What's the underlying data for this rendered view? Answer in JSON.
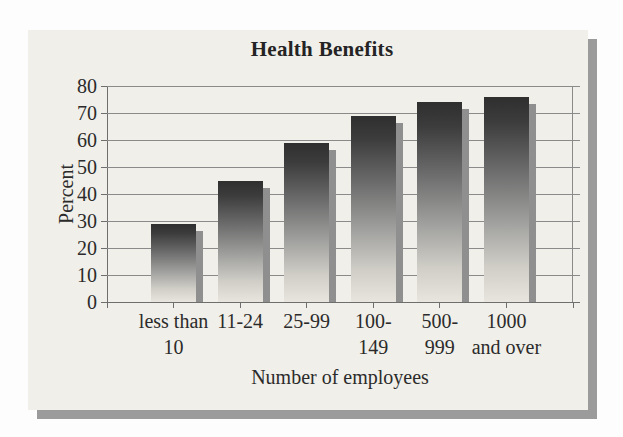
{
  "page": {
    "background": "#fdfdfd"
  },
  "panel": {
    "background": "#f1efe9",
    "shadow_color": "#9b9b9b"
  },
  "chart_data": {
    "type": "bar",
    "title": "Health Benefits",
    "xlabel": "Number of employees",
    "ylabel": "Percent",
    "categories": [
      "less than\n10",
      "11-24",
      "25-99",
      "100-\n149",
      "500-\n999",
      "1000\nand over"
    ],
    "values": [
      29,
      45,
      59,
      69,
      74,
      76
    ],
    "ylim": [
      0,
      80
    ],
    "yticks": [
      0,
      10,
      20,
      30,
      40,
      50,
      60,
      70,
      80
    ],
    "grid": true,
    "legend": "none",
    "bar_style": {
      "gradient_top": "#2f2f2f",
      "gradient_mid": "#a2a2a0",
      "gradient_bottom": "#e7e5dd",
      "shadow_color": "#8f8f8f"
    },
    "gridline_color": "#8a8a8a",
    "axis_color": "#6e6e6e",
    "text_color": "#2b2b2b"
  }
}
